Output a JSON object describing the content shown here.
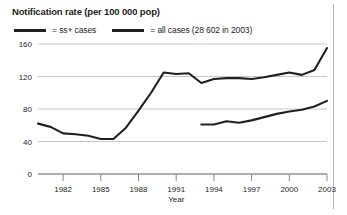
{
  "chart_data": {
    "type": "line",
    "title": "Notification rate (per 100 000 pop)",
    "xlabel": "Year",
    "ylabel": "",
    "ylim": [
      0,
      160
    ],
    "xlim": [
      1980,
      2003
    ],
    "yticks": [
      "0",
      "40",
      "80",
      "120",
      "160"
    ],
    "ytick_values": [
      0,
      40,
      80,
      120,
      160
    ],
    "xticks": [
      "1982",
      "1985",
      "1988",
      "1991",
      "1994",
      "1997",
      "2000",
      "2003"
    ],
    "xtick_values": [
      1982,
      1985,
      1988,
      1991,
      1994,
      1997,
      2000,
      2003
    ],
    "grid": true,
    "legend_position": "top-left",
    "legend": [
      {
        "label": "= ss+ cases",
        "color": "#231f20"
      },
      {
        "label": "= all cases (28 602 in 2003)",
        "color": "#231f20"
      }
    ],
    "series": [
      {
        "name": "all cases",
        "color": "#231f20",
        "x": [
          1980,
          1981,
          1982,
          1983,
          1984,
          1985,
          1986,
          1987,
          1988,
          1989,
          1990,
          1991,
          1992,
          1993,
          1994,
          1995,
          1996,
          1997,
          1998,
          1999,
          2000,
          2001,
          2002,
          2003
        ],
        "values": [
          62,
          58,
          50,
          49,
          47,
          43,
          43,
          57,
          78,
          100,
          125,
          123,
          124,
          112,
          117,
          118,
          118,
          117,
          119,
          122,
          125,
          122,
          128,
          155
        ]
      },
      {
        "name": "ss+ cases",
        "color": "#231f20",
        "x": [
          1993,
          1994,
          1995,
          1996,
          1997,
          1998,
          1999,
          2000,
          2001,
          2002,
          2003
        ],
        "values": [
          61,
          61,
          65,
          63,
          66,
          70,
          74,
          77,
          79,
          83,
          90
        ]
      }
    ]
  },
  "axis": {
    "x_name": "Year"
  }
}
